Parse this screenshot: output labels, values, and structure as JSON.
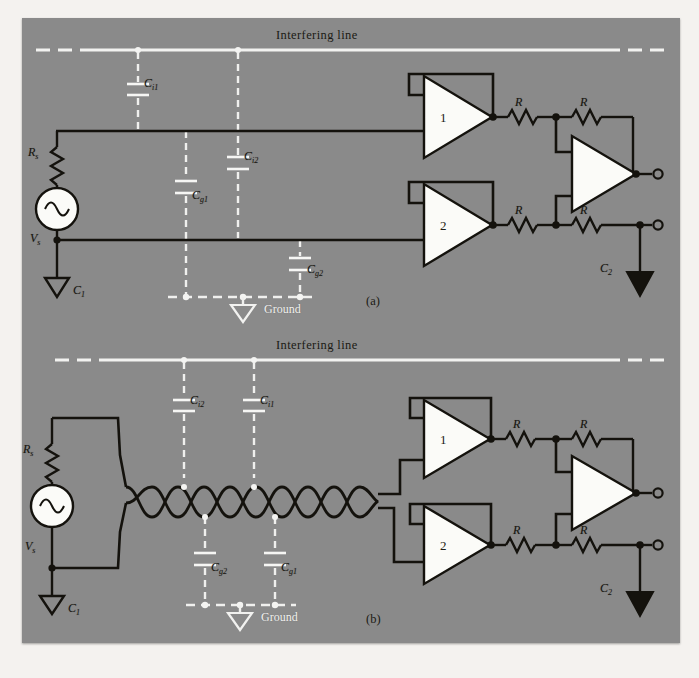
{
  "figure": {
    "background_color": "#8a8a8a",
    "page_color": "#f4f2ef",
    "wire_color": "#14120d",
    "dashed_color": "#f0f0ee",
    "amp_fill": "#fbfbf8"
  },
  "panel_a": {
    "caption": "(a)",
    "interfering_line_label": "Interfering line",
    "ground_label": "Ground",
    "source": {
      "resistor_label": "R",
      "resistor_sub": "s",
      "source_label": "V",
      "source_sub": "s",
      "ground_label": "C",
      "ground_sub": "1",
      "icon": "ac-source-icon"
    },
    "capacitors": [
      {
        "name": "C",
        "sub": "i1",
        "id": "cap-ci1"
      },
      {
        "name": "C",
        "sub": "i2",
        "id": "cap-ci2"
      },
      {
        "name": "C",
        "sub": "g1",
        "id": "cap-cg1"
      },
      {
        "name": "C",
        "sub": "g2",
        "id": "cap-cg2"
      }
    ],
    "amplifiers": [
      {
        "label": "1",
        "id": "buffer-amp-1"
      },
      {
        "label": "2",
        "id": "buffer-amp-2"
      },
      {
        "label": "",
        "id": "difference-amp"
      }
    ],
    "resistors": [
      {
        "label": "R",
        "id": "resistor-top-in"
      },
      {
        "label": "R",
        "id": "resistor-top-fb"
      },
      {
        "label": "R",
        "id": "resistor-bottom-in"
      },
      {
        "label": "R",
        "id": "resistor-bottom-fb"
      }
    ],
    "output_ground": {
      "name": "C",
      "sub": "2",
      "id": "output-ground-c2"
    }
  },
  "panel_b": {
    "caption": "(b)",
    "interfering_line_label": "Interfering line",
    "ground_label": "Ground",
    "cable": "twisted-pair",
    "source": {
      "resistor_label": "R",
      "resistor_sub": "s",
      "source_label": "V",
      "source_sub": "s",
      "ground_label": "C",
      "ground_sub": "1",
      "icon": "ac-source-icon"
    },
    "capacitors": [
      {
        "name": "C",
        "sub": "i2",
        "id": "cap-ci2-b"
      },
      {
        "name": "C",
        "sub": "i1",
        "id": "cap-ci1-b"
      },
      {
        "name": "C",
        "sub": "g2",
        "id": "cap-cg2-b"
      },
      {
        "name": "C",
        "sub": "g1",
        "id": "cap-cg1-b"
      }
    ],
    "amplifiers": [
      {
        "label": "1",
        "id": "buffer-amp-1-b"
      },
      {
        "label": "2",
        "id": "buffer-amp-2-b"
      },
      {
        "label": "",
        "id": "difference-amp-b"
      }
    ],
    "resistors": [
      {
        "label": "R",
        "id": "resistor-top-in-b"
      },
      {
        "label": "R",
        "id": "resistor-top-fb-b"
      },
      {
        "label": "R",
        "id": "resistor-bottom-in-b"
      },
      {
        "label": "R",
        "id": "resistor-bottom-fb-b"
      }
    ],
    "output_ground": {
      "name": "C",
      "sub": "2",
      "id": "output-ground-c2-b"
    }
  }
}
